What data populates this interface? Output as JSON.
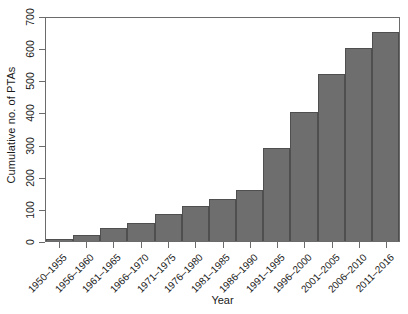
{
  "chart_data": {
    "type": "bar",
    "title": "",
    "xlabel": "Year",
    "ylabel": "Cumulative no. of PTAs",
    "ylim": [
      0,
      700
    ],
    "yticks": [
      0,
      100,
      200,
      300,
      400,
      500,
      600,
      700
    ],
    "grid": false,
    "legend": null,
    "bar_color": "#6e6e6e",
    "bar_edge_color": "#4f4f4f",
    "axis_color": "#6b6b6b",
    "background": "#ffffff",
    "categories": [
      "1950–1955",
      "1956–1960",
      "1961–1965",
      "1966–1970",
      "1971–1975",
      "1976–1980",
      "1981–1985",
      "1986–1990",
      "1991–1995",
      "1996–2000",
      "2001–2005",
      "2006–2010",
      "2011–2016"
    ],
    "values": [
      5,
      20,
      40,
      55,
      85,
      110,
      130,
      160,
      290,
      400,
      520,
      600,
      650
    ]
  }
}
